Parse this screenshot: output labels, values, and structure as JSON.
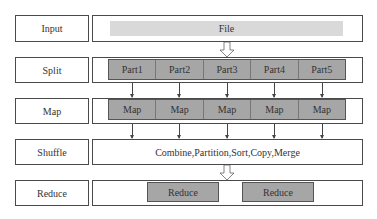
{
  "stages": [
    {
      "label": "Input"
    },
    {
      "label": "Split"
    },
    {
      "label": "Map"
    },
    {
      "label": "Shuffle"
    },
    {
      "label": "Reduce"
    }
  ],
  "input": {
    "file_label": "File"
  },
  "split": {
    "parts": [
      "Part1",
      "Part2",
      "Part3",
      "Part4",
      "Part5"
    ]
  },
  "map": {
    "tasks": [
      "Map",
      "Map",
      "Map",
      "Map",
      "Map"
    ]
  },
  "shuffle": {
    "text": "Combine,Partition,Sort,Copy,Merge"
  },
  "reduce": {
    "tasks": [
      "Reduce",
      "Reduce"
    ]
  },
  "colors": {
    "box_fill": "#a6a6a6",
    "file_fill": "#d9d9d9",
    "border": "#4a4a4a"
  }
}
